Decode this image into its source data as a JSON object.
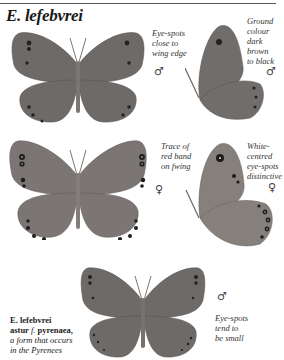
{
  "page": {
    "title": "E. lefebvrei"
  },
  "figures": [
    {
      "id": "male-upperside",
      "annotation": [
        "Eye-spots",
        "close to",
        "wing edge"
      ],
      "sex_symbol": "♂",
      "view": "upperside",
      "ground_color": "#6e6a68"
    },
    {
      "id": "male-underside",
      "annotation": [
        "Ground",
        "colour",
        "dark",
        "brown",
        "to black"
      ],
      "sex_symbol": "♂",
      "view": "underside",
      "ground_color": "#716d6b"
    },
    {
      "id": "female-upperside",
      "annotation": [
        "Trace of",
        "red band",
        "on fwing"
      ],
      "sex_symbol": "♀",
      "view": "upperside",
      "ground_color": "#7b7573"
    },
    {
      "id": "female-underside",
      "annotation": [
        "White-",
        "centred",
        "eye-spots",
        "distinctive"
      ],
      "sex_symbol": "♀",
      "view": "underside",
      "ground_color": "#86807d"
    },
    {
      "id": "astur-pyrenaea-male",
      "annotation": [
        "Eye-spots",
        "tend to",
        "be small"
      ],
      "sex_symbol": "♂",
      "view": "upperside",
      "ground_color": "#6e6a68"
    }
  ],
  "caption": {
    "line1": "E. lefebvrei",
    "line2_bold": "astur ",
    "line2_italic": "f.",
    "line2_bold_end": " pyrenaea,",
    "line3": "a form that occurs",
    "line4": "in the Pyrenees"
  }
}
